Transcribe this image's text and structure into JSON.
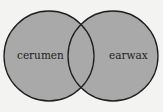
{
  "diagram": {
    "type": "venn",
    "colors": {
      "background": "#f3f3f1",
      "fill": "#a9a9a9",
      "stroke": "#1f1f1f"
    },
    "sets": [
      {
        "label": "cerumen",
        "cx": 49,
        "cy": 56,
        "r": 45
      },
      {
        "label": "earwax",
        "cx": 113,
        "cy": 56,
        "r": 45
      }
    ]
  }
}
